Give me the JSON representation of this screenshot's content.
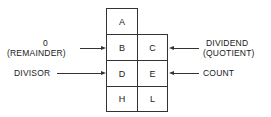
{
  "diagram": {
    "registers": {
      "a": "A",
      "b": "B",
      "c": "C",
      "d": "D",
      "e": "E",
      "h": "H",
      "l": "L"
    },
    "left_labels": {
      "bc_line1": "0",
      "bc_line2": "(REMAINDER)",
      "de": "DIVISOR"
    },
    "right_labels": {
      "bc_line1": "DIVIDEND",
      "bc_line2": "(QUOTIENT)",
      "de": "COUNT"
    }
  }
}
